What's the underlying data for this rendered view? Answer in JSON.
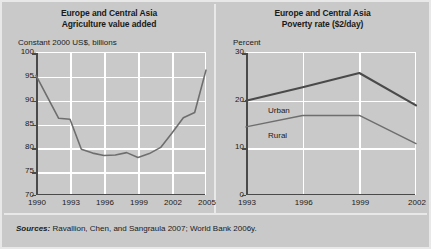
{
  "figure": {
    "background_color": "#c9c9c9",
    "frame_color": "#e8e8e8",
    "grid_color": "#ffffff",
    "axis_color": "#4a4a4a",
    "sources_lead": "Sources:",
    "sources_body": " Ravallion, Chen, and Sangraula 2007; World Bank 2006y."
  },
  "chart_data": [
    {
      "type": "line",
      "panel": "left",
      "title_line1": "Europe and Central Asia",
      "title_line2": "Agriculture value added",
      "ylabel": "Constant 2000 US$, billions",
      "xlabel": "",
      "ylim": [
        70,
        100
      ],
      "xlim": [
        1990,
        2005
      ],
      "yticks": [
        70,
        75,
        80,
        85,
        90,
        95,
        100
      ],
      "ytick_labels": [
        "70",
        "75",
        "80",
        "85",
        "90",
        "95",
        "100"
      ],
      "xticks": [
        1990,
        1993,
        1996,
        1999,
        2002,
        2005
      ],
      "xtick_labels": [
        "1990",
        "1993",
        "1996",
        "1999",
        "2002",
        "2005"
      ],
      "grid": true,
      "legend": "none",
      "line_color": "#6e6e6e",
      "series": [
        {
          "name": "Agriculture value added",
          "x": [
            1990,
            1991,
            1992,
            1993,
            1994,
            1995,
            1996,
            1997,
            1998,
            1999,
            2000,
            2001,
            2002,
            2003,
            2004,
            2005
          ],
          "values": [
            95.3,
            90.8,
            86.3,
            86.1,
            79.8,
            79.0,
            78.5,
            78.6,
            79.1,
            78.1,
            78.9,
            80.2,
            83.2,
            86.4,
            87.5,
            90.4
          ]
        }
      ],
      "note": "1990 start 95.3; trough about 78 near 1996-1999; rises to about 96.4 in 2005",
      "endpoint_2005": 96.4
    },
    {
      "type": "line",
      "panel": "right",
      "title_line1": "Europe and Central Asia",
      "title_line2": "Poverty rate ($2/day)",
      "ylabel": "Percent",
      "xlabel": "",
      "ylim": [
        0,
        30
      ],
      "xlim": [
        1993,
        2002
      ],
      "yticks": [
        0,
        10,
        20,
        30
      ],
      "ytick_labels": [
        "0",
        "10",
        "20",
        "30"
      ],
      "xticks": [
        1993,
        1996,
        1999,
        2002
      ],
      "xtick_labels": [
        "1993",
        "1996",
        "1999",
        "2002"
      ],
      "grid": true,
      "legend": "inline-labels",
      "series": [
        {
          "name": "Urban",
          "label": "Urban",
          "color": "#4a4a4a",
          "x": [
            1993,
            1996,
            1999,
            2002
          ],
          "values": [
            20.0,
            22.8,
            25.8,
            19.0
          ]
        },
        {
          "name": "Rural",
          "label": "Rural",
          "color": "#6e6e6e",
          "x": [
            1993,
            1996,
            1999,
            2002
          ],
          "values": [
            14.5,
            16.9,
            16.9,
            11.0
          ]
        }
      ]
    }
  ]
}
